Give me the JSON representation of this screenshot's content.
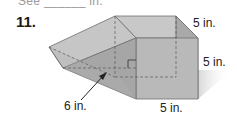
{
  "header": {
    "cut_text": "See ______ in.",
    "problem_number": "11."
  },
  "figure": {
    "labels": {
      "top_right": "5 in.",
      "right": "5 in.",
      "bottom": "5 in.",
      "height_arrow": "6 in."
    },
    "colors": {
      "face_light": "#c9c9c9",
      "face_mid": "#b4b4b4",
      "face_dark": "#a2a2a2",
      "edge": "#6e6e6e",
      "hidden_edge": "#5a5a5a"
    }
  }
}
